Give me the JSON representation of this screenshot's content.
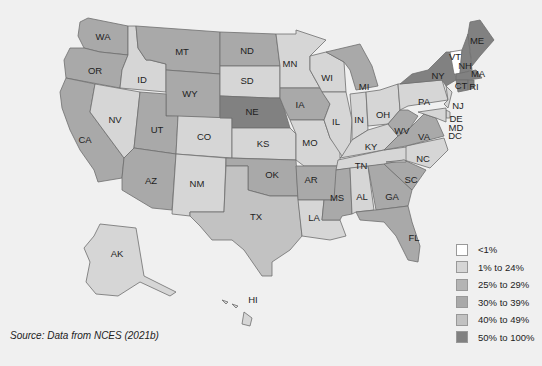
{
  "map": {
    "type": "choropleth",
    "region": "United States",
    "source": "Source: Data from NCES (2021b)",
    "legend": [
      {
        "label": "<1%",
        "color": "#ffffff"
      },
      {
        "label": "1% to 24%",
        "color": "#d6d6d6"
      },
      {
        "label": "25% to 29%",
        "color": "#b4b4b4"
      },
      {
        "label": "30% to 39%",
        "color": "#a9a9a9"
      },
      {
        "label": "40% to 49%",
        "color": "#c2c2c2"
      },
      {
        "label": "50% to 100%",
        "color": "#818181"
      }
    ],
    "states": {
      "WA": "30% to 39%",
      "OR": "30% to 39%",
      "CA": "30% to 39%",
      "ID": "1% to 24%",
      "NV": "1% to 24%",
      "UT": "30% to 39%",
      "AZ": "30% to 39%",
      "MT": "30% to 39%",
      "WY": "30% to 39%",
      "CO": "1% to 24%",
      "NM": "1% to 24%",
      "ND": "30% to 39%",
      "SD": "1% to 24%",
      "NE": "50% to 100%",
      "KS": "1% to 24%",
      "OK": "30% to 39%",
      "TX": "40% to 49%",
      "MN": "1% to 24%",
      "IA": "30% to 39%",
      "MO": "1% to 24%",
      "AR": "30% to 39%",
      "LA": "1% to 24%",
      "WI": "1% to 24%",
      "IL": "1% to 24%",
      "MS": "30% to 39%",
      "MI": "30% to 39%",
      "IN": "1% to 24%",
      "KY": "1% to 24%",
      "TN": "1% to 24%",
      "AL": "1% to 24%",
      "OH": "1% to 24%",
      "WV": "30% to 39%",
      "VA": "30% to 39%",
      "NC": "1% to 24%",
      "SC": "30% to 39%",
      "GA": "30% to 39%",
      "FL": "30% to 39%",
      "PA": "1% to 24%",
      "NY": "50% to 100%",
      "VT": "<1%",
      "NH": "50% to 100%",
      "ME": "50% to 100%",
      "MA": "50% to 100%",
      "CT": "50% to 100%",
      "RI": "50% to 100%",
      "NJ": "1% to 24%",
      "DE": "1% to 24%",
      "MD": "1% to 24%",
      "DC": "1% to 24%",
      "AK": "1% to 24%",
      "HI": "1% to 24%"
    },
    "labels": {
      "WA": "WA",
      "OR": "OR",
      "CA": "CA",
      "ID": "ID",
      "NV": "NV",
      "UT": "UT",
      "AZ": "AZ",
      "MT": "MT",
      "WY": "WY",
      "CO": "CO",
      "NM": "NM",
      "ND": "ND",
      "SD": "SD",
      "NE": "NE",
      "KS": "KS",
      "OK": "OK",
      "TX": "TX",
      "MN": "MN",
      "IA": "IA",
      "MO": "MO",
      "AR": "AR",
      "LA": "LA",
      "WI": "WI",
      "IL": "IL",
      "MS": "MS",
      "MI": "MI",
      "IN": "IN",
      "KY": "KY",
      "TN": "TN",
      "AL": "AL",
      "OH": "OH",
      "WV": "WV",
      "VA": "VA",
      "NC": "NC",
      "SC": "SC",
      "GA": "GA",
      "FL": "FL",
      "PA": "PA",
      "NY": "NY",
      "VT": "VT",
      "NH": "NH",
      "ME": "ME",
      "MA": "MA",
      "CT": "CT",
      "RI": "RI",
      "NJ": "NJ",
      "DE": "DE",
      "MD": "MD",
      "DC": "DC",
      "AK": "AK",
      "HI": "HI"
    }
  }
}
